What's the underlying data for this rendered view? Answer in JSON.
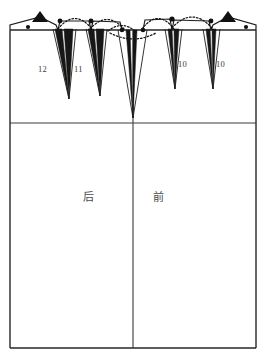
{
  "drawing": {
    "title": "Skirt Pattern Draft",
    "type": "garment-pattern",
    "units": "cm",
    "line_color": "#222222",
    "dart_fill_color": "#1a1a1a",
    "dotted_color": "#111111",
    "background": "#ffffff"
  },
  "frame": {
    "left": 10,
    "right": 256,
    "top": 30,
    "bottom": 348,
    "hip_line_y": 123,
    "center_line_x": 133
  },
  "pieces": [
    {
      "name": "back",
      "label": "后",
      "label_x": 88,
      "label_y": 195
    },
    {
      "name": "front",
      "label": "前",
      "label_x": 158,
      "label_y": 195
    }
  ],
  "darts": [
    {
      "id": "dart-12",
      "label": "12",
      "label_x": 44,
      "label_y": 72,
      "apex_x": 68,
      "tip_y": 100
    },
    {
      "id": "dart-11",
      "label": "11",
      "label_x": 80,
      "label_y": 72,
      "apex_x": 100,
      "tip_y": 97
    },
    {
      "id": "dart-center",
      "label": "",
      "label_x": 0,
      "label_y": 0,
      "apex_x": 133,
      "tip_y": 118
    },
    {
      "id": "dart-10-left",
      "label": "10",
      "label_x": 181,
      "label_y": 67,
      "apex_x": 173,
      "tip_y": 90
    },
    {
      "id": "dart-10-right",
      "label": "10",
      "label_x": 219,
      "label_y": 67,
      "apex_x": 211,
      "tip_y": 90
    }
  ],
  "markers": {
    "corner_triangles": [
      {
        "name": "shoulder-marker-left",
        "x": 40,
        "y": 16
      },
      {
        "name": "shoulder-marker-right",
        "x": 228,
        "y": 16
      }
    ],
    "waist_dots": [
      {
        "x": 28,
        "y": 27
      },
      {
        "x": 60,
        "y": 21
      },
      {
        "x": 91,
        "y": 21
      },
      {
        "x": 122,
        "y": 29
      },
      {
        "x": 143,
        "y": 29
      },
      {
        "x": 172,
        "y": 19
      },
      {
        "x": 211,
        "y": 21
      },
      {
        "x": 246,
        "y": 27
      }
    ]
  },
  "dotted_arcs": [
    {
      "name": "arc-1",
      "x1": 60,
      "x2": 91,
      "peak_y": 12
    },
    {
      "name": "arc-2",
      "x1": 91,
      "x2": 122,
      "peak_y": 14
    },
    {
      "name": "arc-3",
      "x1": 143,
      "x2": 172,
      "peak_y": 12
    },
    {
      "name": "arc-4",
      "x1": 172,
      "x2": 211,
      "peak_y": 11
    }
  ]
}
